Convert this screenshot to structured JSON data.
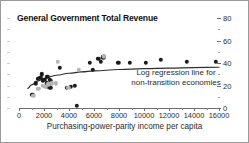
{
  "chart_data": {
    "type": "scatter",
    "title": "General Government Total Revenue",
    "xlabel": "Purchasing-power-parity income per capita",
    "ylabel": "",
    "xlim": [
      0,
      16000
    ],
    "ylim": [
      0,
      80
    ],
    "grid": false,
    "y_axis_position": "right",
    "xticks": [
      0,
      2000,
      4000,
      6000,
      8000,
      10000,
      12000,
      14000,
      16000
    ],
    "xtick_labels": [
      "0",
      "2000",
      "4000",
      "6000",
      "8000",
      "10000",
      "12000",
      "14000",
      "16000"
    ],
    "yticks": [
      0,
      20,
      40,
      60,
      80
    ],
    "ytick_labels": [
      "0",
      "20",
      "40",
      "60",
      "80"
    ],
    "yticks_minor": [
      10,
      30,
      50,
      70
    ],
    "annotations": [
      {
        "name": "regression-label",
        "line1": "Log regression line for",
        "line2": "non-transition economies"
      }
    ],
    "series": [
      {
        "name": "non-transition economies",
        "marker": "filled-circle",
        "color": "#1b1b1b",
        "points": [
          [
            1050,
            12
          ],
          [
            1350,
            22
          ],
          [
            1500,
            26
          ],
          [
            1700,
            27
          ],
          [
            1800,
            30
          ],
          [
            1900,
            24
          ],
          [
            2050,
            25
          ],
          [
            2200,
            22
          ],
          [
            2250,
            28
          ],
          [
            2300,
            19
          ],
          [
            2400,
            21
          ],
          [
            2450,
            25
          ],
          [
            2500,
            18
          ],
          [
            2550,
            24
          ],
          [
            3250,
            36
          ],
          [
            3800,
            18
          ],
          [
            4150,
            19
          ],
          [
            4450,
            20
          ],
          [
            4600,
            2
          ],
          [
            5650,
            40
          ],
          [
            5900,
            34
          ],
          [
            6350,
            44
          ],
          [
            6550,
            41
          ],
          [
            6750,
            45
          ],
          [
            7950,
            40
          ],
          [
            8850,
            40
          ],
          [
            10150,
            40
          ],
          [
            11350,
            43
          ],
          [
            13400,
            41
          ],
          [
            15750,
            41
          ]
        ]
      },
      {
        "name": "transition economies",
        "marker": "filled-circle",
        "color": "#b4b4b4",
        "points": [
          [
            1150,
            11
          ],
          [
            1550,
            17
          ],
          [
            1900,
            20
          ],
          [
            2100,
            19
          ],
          [
            2350,
            21
          ],
          [
            2600,
            22
          ],
          [
            2950,
            22
          ],
          [
            3100,
            41
          ],
          [
            3950,
            18
          ],
          [
            4800,
            34
          ],
          [
            6800,
            46
          ]
        ]
      }
    ],
    "regression": {
      "name": "Log regression line for non-transition economies",
      "type": "log",
      "color": "#2e2e2e",
      "points": [
        [
          700,
          17.5
        ],
        [
          1000,
          20.5
        ],
        [
          1500,
          24.0
        ],
        [
          2000,
          26.3
        ],
        [
          3000,
          29.1
        ],
        [
          4000,
          30.9
        ],
        [
          5000,
          32.1
        ],
        [
          6000,
          33.0
        ],
        [
          8000,
          34.2
        ],
        [
          10000,
          35.0
        ],
        [
          12000,
          35.5
        ],
        [
          14000,
          35.9
        ],
        [
          16000,
          36.2
        ]
      ]
    }
  }
}
